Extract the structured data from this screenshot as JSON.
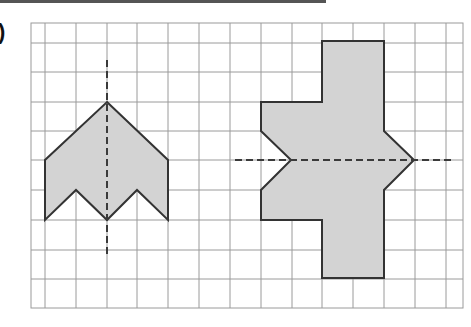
{
  "question_label": ")",
  "colors": {
    "grid": "#9a9a9a",
    "shape_fill": "#d3d3d3",
    "shape_stroke": "#333333",
    "axis": "#3a3a3a",
    "topbar": "#555555"
  },
  "grid": {
    "left": 31,
    "top": 23,
    "right": 463,
    "bottom": 308,
    "x_lines": [
      45,
      76,
      107,
      137,
      168,
      199,
      230,
      261,
      292,
      322,
      353,
      384,
      415,
      446
    ],
    "y_lines": [
      43,
      72,
      102,
      131,
      160,
      190,
      220,
      250,
      279
    ]
  },
  "figures": [
    {
      "name": "arrow-shape",
      "points": "107,102 168,160 168,220 137,190 107,220 76,190 45,220 45,160",
      "axis": {
        "orientation": "vertical",
        "x1": 107,
        "y1": 60,
        "x2": 107,
        "y2": 256
      }
    },
    {
      "name": "cross-shape",
      "points": "322,41 384,41 384,131 414,160 384,190 384,278 322,278 322,220 261,220 261,190 291,160 261,131 261,102 322,102",
      "axis": {
        "orientation": "horizontal",
        "x1": 235,
        "y1": 160,
        "x2": 453,
        "y2": 160
      }
    }
  ]
}
